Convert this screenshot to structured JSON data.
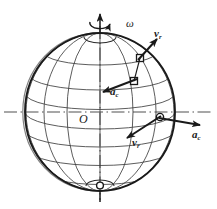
{
  "figure": {
    "kind": "physics-diagram",
    "background_color": "#ffffff",
    "ink_color": "#1a1a1a",
    "grid_color": "#4a4a4a",
    "axis_color": "#6b6b6b"
  },
  "labels": {
    "omega": "ω",
    "origin": "O",
    "v_upper_base": "v",
    "v_upper_sub": "r",
    "v_lower_base": "v",
    "v_lower_sub": "r",
    "a_upper_base": "a",
    "a_upper_sub": "c",
    "a_right_base": "a",
    "a_right_sub": "c"
  },
  "geometry": {
    "sphere_center_x": 100,
    "sphere_center_y": 112,
    "sphere_radius_x": 75,
    "sphere_radius_y": 79,
    "rotation_axis_top_y": 14,
    "rotation_axis_bottom_y": 200,
    "equator_axis_left_x": 4,
    "equator_axis_right_x": 213,
    "latitude_count": 7,
    "longitude_count": 7,
    "markers": [
      {
        "name": "upper-point",
        "x": 140,
        "y": 58
      },
      {
        "name": "mid-point",
        "x": 134,
        "y": 81
      },
      {
        "name": "equator-point",
        "x": 160,
        "y": 117
      },
      {
        "name": "pole-point",
        "x": 100,
        "y": 185
      }
    ],
    "vectors": [
      {
        "name": "v-upper",
        "x1": 140,
        "y1": 58,
        "x2": 156,
        "y2": 40
      },
      {
        "name": "a-upper",
        "x1": 134,
        "y1": 81,
        "x2": 104,
        "y2": 92
      },
      {
        "name": "v-lower",
        "x1": 160,
        "y1": 117,
        "x2": 129,
        "y2": 137
      },
      {
        "name": "a-right",
        "x1": 160,
        "y1": 117,
        "x2": 199,
        "y2": 124
      }
    ]
  }
}
